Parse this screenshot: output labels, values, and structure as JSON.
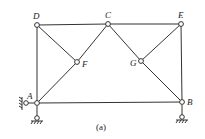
{
  "diagram": {
    "caption": "(a)",
    "nodes": [
      {
        "id": "D",
        "label": "D",
        "x": 37,
        "y": 25
      },
      {
        "id": "C",
        "label": "C",
        "x": 108,
        "y": 24
      },
      {
        "id": "E",
        "label": "E",
        "x": 181,
        "y": 24
      },
      {
        "id": "F",
        "label": "F",
        "x": 77,
        "y": 62
      },
      {
        "id": "G",
        "label": "G",
        "x": 141,
        "y": 61
      },
      {
        "id": "A",
        "label": "A",
        "x": 37,
        "y": 103
      },
      {
        "id": "B",
        "label": "B",
        "x": 182,
        "y": 102
      }
    ],
    "members": [
      [
        "D",
        "C"
      ],
      [
        "C",
        "E"
      ],
      [
        "D",
        "A"
      ],
      [
        "E",
        "B"
      ],
      [
        "A",
        "B"
      ],
      [
        "D",
        "F"
      ],
      [
        "F",
        "A"
      ],
      [
        "F",
        "C"
      ],
      [
        "C",
        "G"
      ],
      [
        "G",
        "B"
      ],
      [
        "G",
        "E"
      ]
    ],
    "supports": [
      {
        "node": "A",
        "type": "pin-vertical"
      },
      {
        "node": "A",
        "type": "pin-horizontal"
      },
      {
        "node": "B",
        "type": "pin-vertical"
      }
    ],
    "colors": {
      "line": "#333333",
      "background": "#ffffff"
    }
  }
}
